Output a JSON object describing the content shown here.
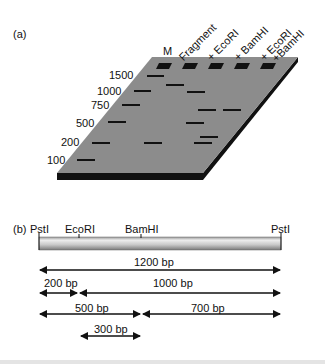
{
  "panel_a": {
    "label": "(a)",
    "lanes": [
      {
        "name": "M",
        "label": "M"
      },
      {
        "name": "fragment",
        "label": "Fragment"
      },
      {
        "name": "ecori",
        "label": "+ EcoRI"
      },
      {
        "name": "bamhi",
        "label": "+ BamHI"
      },
      {
        "name": "ecori-bamhi",
        "label": "+ EcoRI + BamHI",
        "label_line1": "+ EcoRI",
        "label_line2": "+BamHI"
      }
    ],
    "marker_sizes": [
      "1500",
      "1000",
      "750",
      "500",
      "200",
      "100"
    ],
    "bands": {
      "M": [
        1500,
        1000,
        750,
        500,
        200,
        100
      ],
      "Fragment": [
        1200
      ],
      "+ EcoRI": [
        1000,
        200
      ],
      "+ BamHI": [
        700,
        500
      ],
      "+ EcoRI + BamHI": [
        700,
        300,
        200
      ]
    },
    "colors": {
      "gel": "#8c8c8c",
      "gel_edge": "#111111",
      "band": "#111111"
    }
  },
  "panel_b": {
    "label": "(b)",
    "sites": [
      {
        "name": "PstI",
        "label": "PstI",
        "position_bp": 0
      },
      {
        "name": "EcoRI",
        "label": "EcoRI",
        "position_bp": 200
      },
      {
        "name": "BamHI",
        "label": "BamHI",
        "position_bp": 500
      },
      {
        "name": "PstI",
        "label": "PstI",
        "position_bp": 1200
      }
    ],
    "fragments": [
      {
        "label": "1200 bp",
        "start": 0,
        "end": 1200
      },
      {
        "label": "200 bp",
        "start": 0,
        "end": 200
      },
      {
        "label": "1000 bp",
        "start": 200,
        "end": 1200
      },
      {
        "label": "500 bp",
        "start": 0,
        "end": 500
      },
      {
        "label": "700 bp",
        "start": 500,
        "end": 1200
      },
      {
        "label": "300 bp",
        "start": 200,
        "end": 500
      }
    ]
  }
}
